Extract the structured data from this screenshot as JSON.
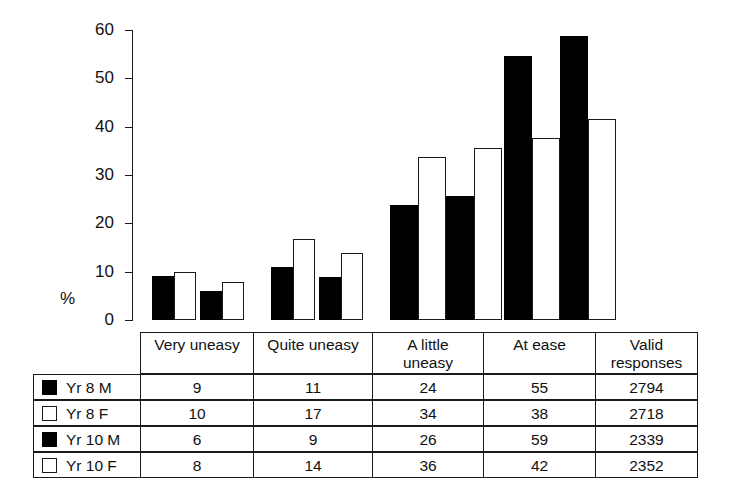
{
  "chart_data": {
    "type": "bar",
    "title": "",
    "xlabel": "",
    "ylabel": "%",
    "ylim": [
      0,
      60
    ],
    "yticks": [
      0,
      10,
      20,
      30,
      40,
      50,
      60
    ],
    "ytick_labels": [
      "0",
      "10",
      "20",
      "30",
      "40",
      "50",
      "60"
    ],
    "grid": false,
    "legend_position": "table-left-column",
    "categories": [
      "Very uneasy",
      "Quite uneasy",
      "A little uneasy",
      "At ease"
    ],
    "series": [
      {
        "name": "Yr 8 M",
        "swatch": "filled",
        "values": [
          9,
          11,
          24,
          55
        ],
        "plotted": [
          9.2,
          11.0,
          23.8,
          54.7
        ],
        "valid_responses": 2794
      },
      {
        "name": "Yr 8 F",
        "swatch": "hollow",
        "values": [
          10,
          17,
          34,
          38
        ],
        "plotted": [
          9.9,
          16.8,
          33.7,
          37.6
        ],
        "valid_responses": 2718
      },
      {
        "name": "Yr 10 M",
        "swatch": "filled",
        "values": [
          6,
          9,
          26,
          59
        ],
        "plotted": [
          6.0,
          8.9,
          25.7,
          58.7
        ],
        "valid_responses": 2339
      },
      {
        "name": "Yr 10 F",
        "swatch": "hollow",
        "values": [
          8,
          14,
          36,
          42
        ],
        "plotted": [
          7.9,
          13.8,
          35.6,
          41.5
        ],
        "valid_responses": 2352
      }
    ]
  },
  "axis": {
    "percent_symbol": "%",
    "ticks": [
      {
        "label": "60",
        "value": 60
      },
      {
        "label": "50",
        "value": 50
      },
      {
        "label": "40",
        "value": 40
      },
      {
        "label": "30",
        "value": 30
      },
      {
        "label": "20",
        "value": 20
      },
      {
        "label": "10",
        "value": 10
      },
      {
        "label": "0",
        "value": 0
      }
    ]
  },
  "table": {
    "headers": [
      {
        "line1": "Very uneasy",
        "line2": ""
      },
      {
        "line1": "Quite uneasy",
        "line2": ""
      },
      {
        "line1": "A little",
        "line2": "uneasy"
      },
      {
        "line1": "At ease",
        "line2": ""
      },
      {
        "line1": "Valid",
        "line2": "responses"
      }
    ],
    "rows": [
      {
        "swatch": "filled",
        "label": "Yr 8 M",
        "cells": [
          "9",
          "11",
          "24",
          "55",
          "2794"
        ]
      },
      {
        "swatch": "hollow",
        "label": "Yr 8 F",
        "cells": [
          "10",
          "17",
          "34",
          "38",
          "2718"
        ]
      },
      {
        "swatch": "filled",
        "label": "Yr 10 M",
        "cells": [
          "6",
          "9",
          "26",
          "59",
          "2339"
        ]
      },
      {
        "swatch": "hollow",
        "label": "Yr 10 F",
        "cells": [
          "8",
          "14",
          "36",
          "42",
          "2352"
        ]
      }
    ]
  },
  "colors": {
    "male_bar": "#000000",
    "female_bar": "#ffffff",
    "stroke": "#1a1a1a",
    "background": "#ffffff"
  },
  "geometry": {
    "baseline_y": 320,
    "top_y": 30,
    "axis_x": 132,
    "group_starts": [
      152,
      271,
      390,
      504
    ],
    "bar_width_narrow": 22,
    "bar_width_wide": 28,
    "pair_gap": 4,
    "table_left": 33,
    "table_right": 697,
    "col_edges": [
      140,
      253,
      372,
      483,
      595,
      697
    ],
    "header_top": 332,
    "header_bottom": 374,
    "row_height": 26
  }
}
